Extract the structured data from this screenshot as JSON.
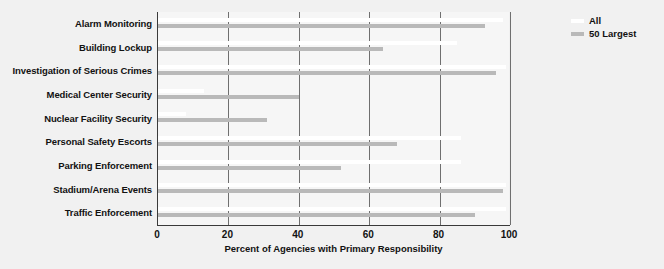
{
  "chart_data": {
    "type": "bar",
    "orientation": "horizontal",
    "title": "",
    "xlabel": "Percent of Agencies with Primary Responsibility",
    "ylabel": "",
    "xlim": [
      0,
      100
    ],
    "xticks": [
      0,
      20,
      40,
      60,
      80,
      100
    ],
    "xtick_labels": [
      "0",
      "20",
      "40",
      "60",
      "80",
      "100"
    ],
    "grid": true,
    "grid_axis": "x",
    "legend_position": "top-right",
    "categories": [
      "Alarm Monitoring",
      "Building Lockup",
      "Investigation of Serious Crimes",
      "Medical Center Security",
      "Nuclear Facility Security",
      "Personal Safety Escorts",
      "Parking Enforcement",
      "Stadium/Arena Events",
      "Traffic Enforcement"
    ],
    "series": [
      {
        "name": "All",
        "color": "#ffffff",
        "values": [
          98,
          85,
          99,
          13,
          8,
          86,
          86,
          99,
          99
        ]
      },
      {
        "name": "50 Largest",
        "color": "#b9b9b9",
        "values": [
          93,
          64,
          96,
          40,
          31,
          68,
          52,
          98,
          90
        ]
      }
    ]
  },
  "legend": {
    "items": [
      {
        "label": "All",
        "color": "#ffffff"
      },
      {
        "label": "50 Largest",
        "color": "#b9b9b9"
      }
    ]
  },
  "colors": {
    "figure_background": "#f1f1f1",
    "plot_background": "#f6f6f6",
    "axis": "#3a3a3a",
    "gridline": "#6f6f6f",
    "text": "#121212"
  }
}
